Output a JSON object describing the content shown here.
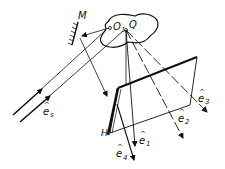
{
  "diagram": {
    "labels": {
      "mirror": "M",
      "point_o1": "O",
      "point_o1_sub": "1",
      "point_q": "Q",
      "plate": "H",
      "e_s": "e",
      "e_s_sub": "s",
      "e1": "e",
      "e1_sub": "1",
      "e2": "e",
      "e2_sub": "2",
      "e3": "e",
      "e3_sub": "3",
      "e4": "e",
      "e4_sub": "4",
      "hat": "^"
    },
    "colors": {
      "ink": "#111111",
      "background": "#ffffff"
    }
  }
}
